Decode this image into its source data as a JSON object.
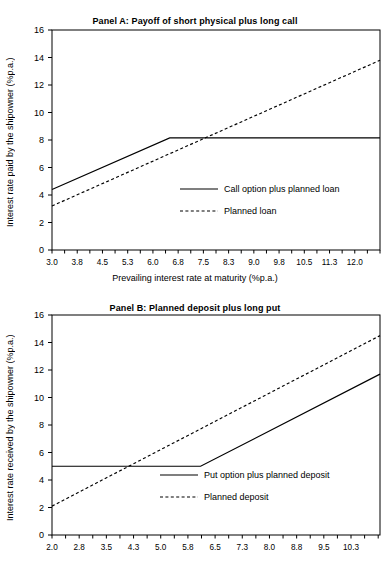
{
  "figure": {
    "background": "#ffffff",
    "line_color": "#000000"
  },
  "chart_data": [
    {
      "id": "panel-a",
      "type": "line",
      "title": "Panel A: Payoff of short physical plus long call",
      "xlabel": "Prevailing interest rate at maturity (%p.a.)",
      "ylabel": "Interest rate paid by the shipowner (%p.a.)",
      "xlim": [
        3.0,
        12.75
      ],
      "ylim": [
        0,
        16
      ],
      "ytick_labels": [
        "0",
        "2",
        "4",
        "6",
        "8",
        "10",
        "12",
        "14",
        "16"
      ],
      "ytick_values": [
        0,
        2,
        4,
        6,
        8,
        10,
        12,
        14,
        16
      ],
      "xtick_labels": [
        "3.0",
        "3.8",
        "4.5",
        "5.3",
        "6.0",
        "6.8",
        "7.5",
        "8.3",
        "9.0",
        "9.8",
        "10.5",
        "11.3",
        "12.0"
      ],
      "xtick_values": [
        3.0,
        3.75,
        4.5,
        5.25,
        6.0,
        6.75,
        7.5,
        8.25,
        9.0,
        9.75,
        10.5,
        11.25,
        12.0
      ],
      "minor_tick_step": 0.375,
      "grid": false,
      "legend_position": "lower-right",
      "series": [
        {
          "name": "Call option plus planned loan",
          "style": "solid",
          "x": [
            3.0,
            6.5,
            12.75
          ],
          "y": [
            4.4,
            8.15,
            8.15
          ]
        },
        {
          "name": "Planned loan",
          "style": "dotted",
          "x": [
            3.0,
            12.75
          ],
          "y": [
            3.2,
            13.8
          ]
        }
      ]
    },
    {
      "id": "panel-b",
      "type": "line",
      "title": "Panel B: Planned deposit plus long put",
      "xlabel": "",
      "ylabel": "Interest rate received by the shipowner (%p.a.)",
      "xlim": [
        2.0,
        11.05
      ],
      "ylim": [
        0,
        16
      ],
      "ytick_labels": [
        "0",
        "2",
        "4",
        "6",
        "8",
        "10",
        "12",
        "14",
        "16"
      ],
      "ytick_values": [
        0,
        2,
        4,
        6,
        8,
        10,
        12,
        14,
        16
      ],
      "xtick_labels": [
        "2.0",
        "2.8",
        "3.5",
        "4.3",
        "5.0",
        "5.8",
        "6.5",
        "7.3",
        "8.0",
        "8.8",
        "9.5",
        "10.3"
      ],
      "xtick_values": [
        2.0,
        2.75,
        3.5,
        4.25,
        5.0,
        5.75,
        6.5,
        7.25,
        8.0,
        8.75,
        9.5,
        10.25
      ],
      "minor_tick_step": 0.375,
      "grid": false,
      "legend_position": "lower-right",
      "series": [
        {
          "name": "Put option plus planned deposit",
          "style": "solid",
          "x": [
            2.0,
            6.1,
            11.05
          ],
          "y": [
            5.0,
            5.0,
            11.7
          ]
        },
        {
          "name": "Planned deposit",
          "style": "dotted",
          "x": [
            2.0,
            11.05
          ],
          "y": [
            2.1,
            14.5
          ]
        }
      ]
    }
  ]
}
